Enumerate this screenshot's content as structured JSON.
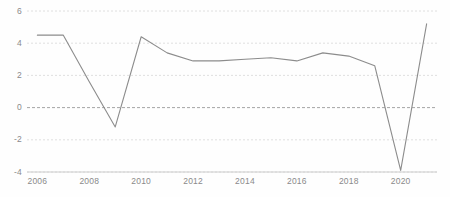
{
  "chart_data": {
    "type": "line",
    "title": "",
    "subtitle": "",
    "xlabel": "",
    "ylabel": "",
    "grid": true,
    "legend": null,
    "legend_position": "none",
    "xlim": [
      2005.6,
      2021.4
    ],
    "ylim": [
      -4,
      6
    ],
    "x_ticks": [
      2006,
      2008,
      2010,
      2012,
      2014,
      2016,
      2018,
      2020
    ],
    "x_tick_labels": [
      "2006",
      "2008",
      "2010",
      "2012",
      "2014",
      "2016",
      "2018",
      "2020"
    ],
    "y_ticks": [
      -4,
      -2,
      0,
      2,
      4,
      6
    ],
    "y_tick_labels": [
      "-4",
      "-2",
      "0",
      "2",
      "4",
      "6"
    ],
    "zero_line": 0,
    "line_color": "#8c8c8c",
    "grid_color": "#d8d8d8",
    "zero_line_color": "#9a9a9a",
    "axis_color": "#cccccc",
    "tick_label_color": "#8a8a8a",
    "background_color": "#fefefe",
    "x": [
      2006,
      2007,
      2008,
      2009,
      2010,
      2011,
      2012,
      2013,
      2014,
      2015,
      2016,
      2017,
      2018,
      2019,
      2020,
      2021
    ],
    "series": [
      {
        "name": "",
        "values": [
          4.5,
          4.5,
          1.6,
          -1.2,
          4.4,
          3.4,
          2.9,
          2.9,
          3.0,
          3.1,
          2.9,
          3.4,
          3.2,
          2.6,
          -3.9,
          5.2
        ]
      }
    ]
  }
}
